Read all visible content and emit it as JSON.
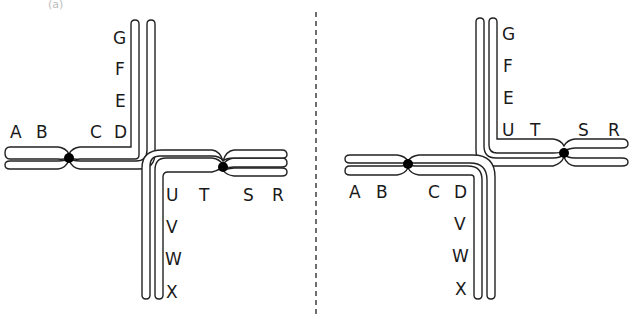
{
  "figure": {
    "caption_partial": "(a)",
    "divider": "dashed-vertical",
    "panels": [
      {
        "id": "left",
        "description": "Two chromosomes with arms bent at right angles",
        "chromosome_1": {
          "horizontal_labels": [
            "A",
            "B",
            "C",
            "D"
          ],
          "vertical_labels": [
            "E",
            "F",
            "G"
          ]
        },
        "chromosome_2": {
          "horizontal_labels": [
            "U",
            "T",
            "S",
            "R"
          ],
          "vertical_labels": [
            "V",
            "W",
            "X"
          ]
        }
      },
      {
        "id": "right",
        "description": "Translocated chromosomes with swapped arms",
        "chromosome_1": {
          "vertical_labels": [
            "G",
            "F",
            "E"
          ],
          "horizontal_labels": [
            "U",
            "T",
            "S",
            "R"
          ]
        },
        "chromosome_2": {
          "horizontal_labels": [
            "A",
            "B",
            "C",
            "D"
          ],
          "vertical_labels": [
            "V",
            "W",
            "X"
          ]
        }
      }
    ]
  },
  "labels": {
    "L": {
      "A": "A",
      "B": "B",
      "C": "C",
      "D": "D",
      "E": "E",
      "F": "F",
      "G": "G",
      "U": "U",
      "T": "T",
      "S": "S",
      "R": "R",
      "V": "V",
      "W": "W",
      "X": "X"
    },
    "R": {
      "G": "G",
      "F": "F",
      "E": "E",
      "U": "U",
      "T": "T",
      "S": "S",
      "R": "R",
      "A": "A",
      "B": "B",
      "C": "C",
      "D": "D",
      "V": "V",
      "W": "W",
      "X": "X"
    }
  },
  "colors": {
    "stroke": "#222222",
    "centromere": "#000000",
    "background": "#ffffff"
  }
}
